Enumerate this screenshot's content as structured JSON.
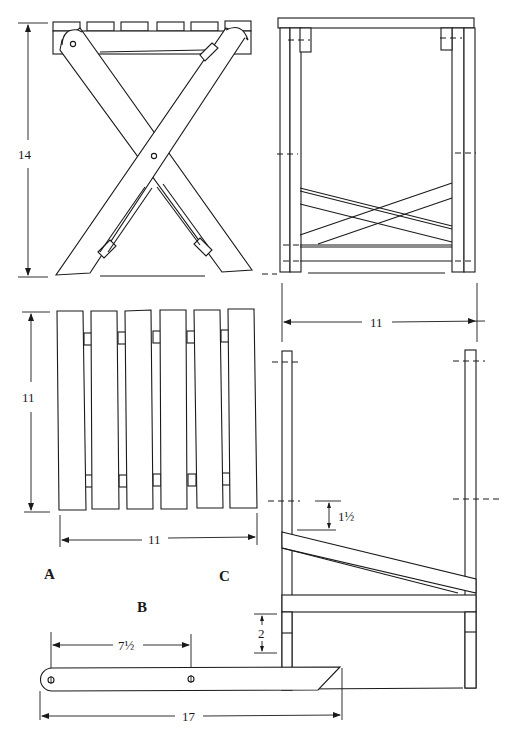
{
  "drawing": {
    "subject": "folding stool",
    "views": {
      "side": {
        "height_label": "14"
      },
      "seat_top": {
        "label": "A",
        "height_label": "11",
        "width_label": "11",
        "slat_count": 6
      },
      "leg": {
        "label": "B",
        "pivot_spacing_label": "7½",
        "length_label": "17"
      },
      "inner_frame": {
        "label": "C",
        "width_label": "11",
        "offset_label": "1½",
        "foot_label": "2"
      }
    },
    "caption": ""
  },
  "colors": {
    "line": "#1a1a1a",
    "background": "#ffffff"
  }
}
